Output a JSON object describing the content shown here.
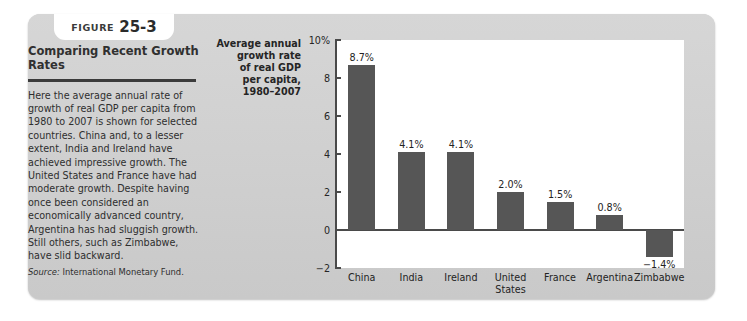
{
  "figure": {
    "label": "FIGURE",
    "number": "25-3",
    "headline": "Comparing Recent Growth Rates",
    "body": "Here the average annual rate of growth of real GDP per capita from 1980 to 2007 is shown for selected countries. China and, to a lesser extent, India and Ireland have achieved impressive growth. The United States and France have had moderate growth. Despite having once been considered an economically advanced country, Argentina has had sluggish growth. Still others, such as Zimbabwe, have slid backward.",
    "source_label": "Source:",
    "source_text": "International Monetary Fund."
  },
  "colors": {
    "card_background": "#d2d2d2",
    "plot_background": "#ffffff",
    "bar_fill": "#565656",
    "axis": "#4a4a4a",
    "text": "#252525"
  },
  "chart_data": {
    "type": "bar",
    "title": "",
    "ylabel": "Average annual growth rate of real GDP per capita, 1980–2007",
    "ylabel_lines": [
      "Average annual",
      "growth rate",
      "of real GDP",
      "per capita,",
      "1980–2007"
    ],
    "xlabel": "",
    "categories": [
      "China",
      "India",
      "Ireland",
      "United\nStates",
      "France",
      "Argentina",
      "Zimbabwe"
    ],
    "values": [
      8.7,
      4.1,
      4.1,
      2.0,
      1.5,
      0.8,
      -1.4
    ],
    "data_labels": [
      "8.7%",
      "4.1%",
      "4.1%",
      "2.0%",
      "1.5%",
      "0.8%",
      "−1.4%"
    ],
    "ylim": [
      -2,
      10
    ],
    "yticks": [
      10,
      8,
      6,
      4,
      2,
      0,
      -2
    ],
    "ytick_labels": [
      "10%",
      "8",
      "6",
      "4",
      "2",
      "0",
      "−2"
    ],
    "grid": false,
    "legend": false
  }
}
